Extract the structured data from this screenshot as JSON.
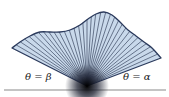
{
  "diagram": {
    "labels": {
      "left_ray": "θ = β",
      "right_ray": "θ = α"
    },
    "colors": {
      "region_fill": "#c9d9eb",
      "boundary_stroke": "#2b3a5c",
      "ray_stroke": "#3a4660",
      "axis": "#8a8a8a",
      "apex": "#000000"
    },
    "geometry": {
      "apex": [
        87,
        86
      ],
      "axis_y": 90,
      "axis_x_range": [
        4,
        166
      ],
      "boundary_curve": [
        [
          12,
          48
        ],
        [
          20,
          42
        ],
        [
          30,
          36
        ],
        [
          40,
          32
        ],
        [
          50,
          32
        ],
        [
          60,
          32
        ],
        [
          70,
          30
        ],
        [
          80,
          25
        ],
        [
          88,
          19
        ],
        [
          96,
          14
        ],
        [
          104,
          12
        ],
        [
          112,
          15
        ],
        [
          120,
          22
        ],
        [
          128,
          30
        ],
        [
          136,
          36
        ],
        [
          144,
          42
        ],
        [
          152,
          48
        ],
        [
          161,
          58
        ]
      ],
      "ray_count": 34
    }
  }
}
